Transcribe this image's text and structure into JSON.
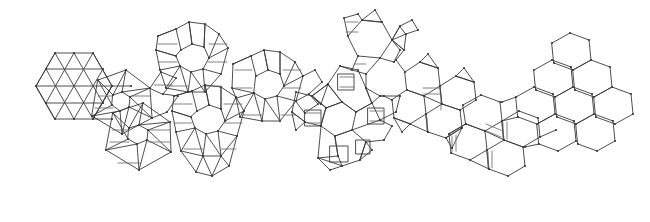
{
  "figure": {
    "description": "A horizontal chain of planar tiling patches morphing from a triangular tiling on the left, through trihexagonal, rhombitrihexagonal, snub and truncated Archimedean tilings, into a plain hexagonal honeycomb on the right.",
    "background_color": "#ffffff",
    "line_color": "#3a3a3a",
    "soft_line_color": "#6d6d6d",
    "vertex_color": "#3a3a3a",
    "stroke_width": 0.9,
    "width": 650,
    "height": 222
  },
  "chart_data": {
    "type": "diagram",
    "xlabel": "",
    "ylabel": "",
    "clusters": [
      {
        "id": "c1",
        "name": "triangular-patch",
        "label": "triangular tiling",
        "center_x": 72,
        "center_y": 85,
        "radius": 38,
        "vertex_config": "3.3.3.3.3.3",
        "polygons": "triangles"
      },
      {
        "id": "c2",
        "name": "upper-rosette-left",
        "label": "triangle rosette",
        "center_x": 118,
        "center_y": 100,
        "radius": 30,
        "vertex_config": "3.3.3.3.3.3",
        "polygons": "triangles, elongated squares"
      },
      {
        "id": "c3",
        "name": "lower-rosette",
        "label": "triangle rosette",
        "center_x": 135,
        "center_y": 136,
        "radius": 30,
        "vertex_config": "3.3.3.3.3.3",
        "polygons": "triangles, elongated squares"
      },
      {
        "id": "c4",
        "name": "rhombicuboctahedral-patch-upper",
        "label": "rhombi-patch",
        "center_x": 189,
        "center_y": 56,
        "radius": 36,
        "vertex_config": "3.4.4.4",
        "polygons": "octagon core, squares, triangles"
      },
      {
        "id": "c5",
        "name": "rhombicuboctahedral-patch-mid",
        "label": "rhombi-patch",
        "center_x": 205,
        "center_y": 118,
        "radius": 36,
        "vertex_config": "3.4.4.4",
        "polygons": "octagon core, squares, triangles"
      },
      {
        "id": "c6",
        "name": "rhombicuboctahedral-patch-right",
        "label": "rhombi-patch",
        "center_x": 264,
        "center_y": 83,
        "radius": 36,
        "vertex_config": "3.4.4.4",
        "polygons": "octagon core, squares, triangles"
      },
      {
        "id": "c7",
        "name": "rhombitrihexagonal-patch",
        "label": "rhombitrihexagonal tiling",
        "center_x": 335,
        "center_y": 118,
        "radius": 48,
        "vertex_config": "3.4.6.4",
        "polygons": "hexagons, squares, triangles"
      },
      {
        "id": "c8",
        "name": "truncated-hex-patch-upper",
        "label": "truncated hexagonal patch",
        "center_x": 362,
        "center_y": 45,
        "radius": 38,
        "vertex_config": "3.4.6.4",
        "polygons": "hexagons, squares, triangles"
      },
      {
        "id": "c9",
        "name": "narrow-square-hex-patch",
        "label": "narrowing squares",
        "center_x": 430,
        "center_y": 95,
        "radius": 42,
        "vertex_config": "3.4.6.4",
        "polygons": "hexagons, thin squares, thin triangles"
      },
      {
        "id": "c10",
        "name": "near-hexagonal-patch",
        "label": "near hexagonal",
        "center_x": 500,
        "center_y": 125,
        "radius": 44,
        "vertex_config": "6.6.6",
        "polygons": "hexagons, vestigial squares"
      },
      {
        "id": "c11",
        "name": "hexagonal-honeycomb-patch",
        "label": "hexagonal tiling",
        "center_x": 580,
        "center_y": 85,
        "radius": 50,
        "vertex_config": "6.6.6",
        "polygons": "hexagons"
      }
    ],
    "links": [
      {
        "from": "c1",
        "to": "c2"
      },
      {
        "from": "c2",
        "to": "c3"
      },
      {
        "from": "c2",
        "to": "c4"
      },
      {
        "from": "c3",
        "to": "c5"
      },
      {
        "from": "c4",
        "to": "c5"
      },
      {
        "from": "c5",
        "to": "c6"
      },
      {
        "from": "c6",
        "to": "c7"
      },
      {
        "from": "c7",
        "to": "c8"
      },
      {
        "from": "c8",
        "to": "c9"
      },
      {
        "from": "c9",
        "to": "c10"
      },
      {
        "from": "c10",
        "to": "c11"
      }
    ],
    "notes": [
      "Left end: pure equilateral-triangle tiling patch.",
      "Middle: Archimedean tilings with squares and triangles between polygons.",
      "Right end: pure regular-hexagon honeycomb."
    ]
  }
}
